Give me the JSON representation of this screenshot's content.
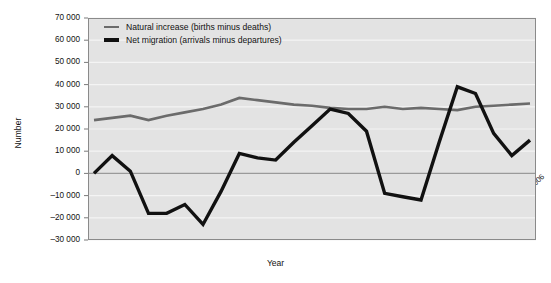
{
  "chart_data": {
    "type": "line",
    "title": "",
    "xlabel": "Year",
    "ylabel": "Number",
    "grid": true,
    "legend_position": "top-left-inside",
    "ylim": [
      -30000,
      70000
    ],
    "ytick_step": 10000,
    "categories": [
      "1982",
      "1983",
      "1984",
      "1985",
      "1986",
      "1987",
      "1988",
      "1989",
      "1990",
      "1991",
      "1992",
      "1993",
      "1994",
      "1995",
      "1996",
      "1997",
      "1998",
      "1999",
      "2000",
      "2001",
      "2002",
      "2003",
      "2004",
      "2005",
      "2006"
    ],
    "ytick_labels": [
      "70 000",
      "60 000",
      "50 000",
      "40 000",
      "30 000",
      "20 000",
      "10 000",
      "0",
      "–10 000",
      "–20 000",
      "–30 000"
    ],
    "ytick_values": [
      70000,
      60000,
      50000,
      40000,
      30000,
      20000,
      10000,
      0,
      -10000,
      -20000,
      -30000
    ],
    "series": [
      {
        "name": "Natural increase (births minus deaths)",
        "color": "#6b6b6b",
        "width": 2.6,
        "values": [
          24000,
          25000,
          26000,
          24000,
          26000,
          27500,
          29000,
          31000,
          34000,
          33000,
          32000,
          31000,
          30500,
          29500,
          29000,
          29000,
          30000,
          29000,
          29500,
          29000,
          28500,
          30000,
          30500,
          31000,
          31500
        ]
      },
      {
        "name": "Net migration (arrivals minus departures)",
        "color": "#111111",
        "width": 3.4,
        "values": [
          0,
          8000,
          1000,
          -18000,
          -18000,
          -14000,
          -23000,
          -8000,
          9000,
          7000,
          6000,
          14000,
          21500,
          29000,
          27000,
          19000,
          -9000,
          -10500,
          -12000,
          14000,
          39000,
          36000,
          18000,
          8000,
          15000
        ]
      }
    ]
  },
  "legend": {
    "items": [
      {
        "label": "Natural increase (births minus deaths)",
        "swatch": "gray-line-swatch"
      },
      {
        "label": "Net migration (arrivals minus departures)",
        "swatch": "black-line-swatch"
      }
    ]
  },
  "axes": {
    "x_title": "Year",
    "y_title": "Number"
  },
  "colors": {
    "plot_background": "#e3e3e3",
    "gridline": "#f4f4f4",
    "border": "#8a8a8a",
    "natural_increase": "#6b6b6b",
    "net_migration": "#111111",
    "text": "#111111"
  }
}
